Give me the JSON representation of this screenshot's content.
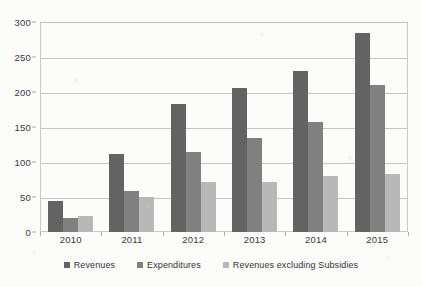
{
  "chart_data": {
    "type": "bar",
    "title": "",
    "subtitle": "",
    "xlabel": "",
    "ylabel": "",
    "categories": [
      "2010",
      "2011",
      "2012",
      "2013",
      "2014",
      "2015"
    ],
    "series": [
      {
        "name": "Revenues",
        "color": "#636363",
        "values": [
          45,
          112,
          183,
          206,
          230,
          285
        ]
      },
      {
        "name": "Expenditures",
        "color": "#808080",
        "values": [
          20,
          59,
          115,
          134,
          157,
          210
        ]
      },
      {
        "name": "Revenues excluding Subsidies",
        "color": "#b8b8b8",
        "values": [
          23,
          50,
          72,
          72,
          80,
          83
        ]
      }
    ],
    "ylim": [
      0,
      300
    ],
    "yticks": [
      0,
      50,
      100,
      150,
      200,
      250,
      300
    ],
    "ytick_labels": [
      "0",
      "50",
      "100",
      "150",
      "200",
      "250",
      "300"
    ],
    "grid": true,
    "grid_axis": "y",
    "legend_position": "bottom",
    "plot_border": true
  },
  "colors": {
    "background": "#fcfcfa",
    "gridline": "#c4c4c4",
    "axis_text": "#3a3a3a",
    "plot_border": "#c9c9c9",
    "series_1": "#636363",
    "series_2": "#808080",
    "series_3": "#b8b8b8"
  }
}
